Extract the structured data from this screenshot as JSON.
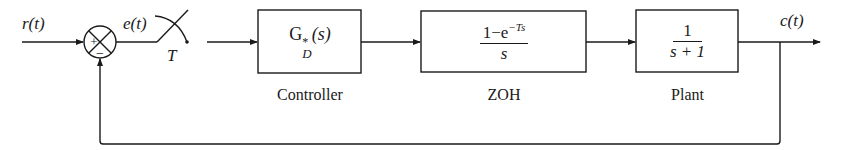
{
  "signals": {
    "input": "r(t)",
    "error": "e(t)",
    "output": "c(t)",
    "sampler_period": "T"
  },
  "summing_junction": {
    "plus": "+",
    "minus": "−"
  },
  "blocks": [
    {
      "id": "controller",
      "label": "Controller",
      "tf": "G",
      "tf_sup": "*",
      "tf_sub": "D",
      "tf_arg": "(s)"
    },
    {
      "id": "zoh",
      "label": "ZOH",
      "num": "1−e",
      "num_sup": "−Ts",
      "den": "s"
    },
    {
      "id": "plant",
      "label": "Plant",
      "num": "1",
      "den": "s + 1"
    }
  ]
}
